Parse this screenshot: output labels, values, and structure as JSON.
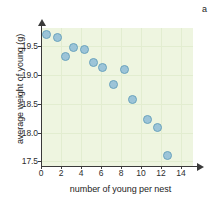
{
  "chart_data": {
    "type": "scatter",
    "title": "",
    "panel_label": "a",
    "xlabel": "number of young per nest",
    "ylabel": "average weight of young (g)",
    "xlim": [
      0,
      15.2
    ],
    "ylim": [
      17.42,
      19.82
    ],
    "xticks": [
      0,
      2,
      4,
      6,
      8,
      10,
      12,
      14
    ],
    "xtick_labels": [
      "0",
      "2",
      "4",
      "6",
      "8",
      "10",
      "12",
      "14"
    ],
    "yticks": [
      17.5,
      18.0,
      18.5,
      19.0,
      19.5
    ],
    "ytick_labels": [
      "17.5",
      "18.0",
      "18.5",
      "19.0",
      "19.5"
    ],
    "grid": true,
    "legend": "none",
    "marker": {
      "shape": "circle",
      "fill_color": "#9cc4d8",
      "edge_color": "#6ba3bd",
      "size_px": 9
    },
    "plot_background": "#eef5e0",
    "axis_color": "#3a3a3a",
    "points": [
      {
        "x": 0.5,
        "y": 19.7
      },
      {
        "x": 1.6,
        "y": 19.66
      },
      {
        "x": 2.4,
        "y": 19.33
      },
      {
        "x": 3.2,
        "y": 19.48
      },
      {
        "x": 4.3,
        "y": 19.45
      },
      {
        "x": 5.2,
        "y": 19.22
      },
      {
        "x": 6.1,
        "y": 19.13
      },
      {
        "x": 7.2,
        "y": 18.84
      },
      {
        "x": 8.3,
        "y": 19.1
      },
      {
        "x": 9.1,
        "y": 18.58
      },
      {
        "x": 10.6,
        "y": 18.23
      },
      {
        "x": 11.6,
        "y": 18.09
      },
      {
        "x": 12.6,
        "y": 17.6
      }
    ]
  }
}
